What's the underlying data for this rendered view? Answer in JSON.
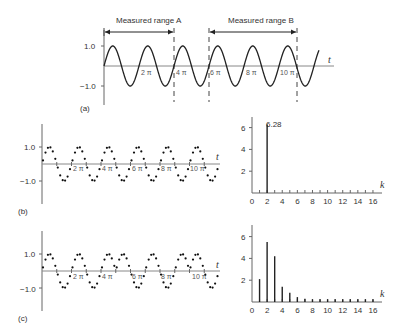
{
  "figure": {
    "panel_a": {
      "label": "(a)",
      "range_a_label": "Measured range A",
      "range_b_label": "Measured range B",
      "y_ticks": [
        "1.0",
        "−1.0"
      ],
      "x_axis_label": "t",
      "x_tick_labels": [
        "2 π",
        "4 π",
        "6 π",
        "8 π",
        "10 π"
      ]
    },
    "panel_b": {
      "label": "(b)",
      "y_ticks": [
        "1.0",
        "−1.0"
      ],
      "x_axis_label": "t",
      "x_tick_labels": [
        "2 π",
        "4 π",
        "6 π",
        "8 π",
        "10 π"
      ]
    },
    "panel_c": {
      "label": "(c)",
      "y_ticks": [
        "1.0",
        "−1.0"
      ],
      "x_axis_label": "t",
      "x_tick_labels": [
        "2 π",
        "4 π",
        "6 π",
        "8 π",
        "10 π"
      ]
    }
  },
  "chart_data": [
    {
      "type": "line",
      "title": "(a) Continuous sine wave with measured ranges A and B",
      "xlabel": "t",
      "ylabel": "",
      "yticks": [
        1.0,
        -1.0
      ],
      "x_tick_labels": [
        "2π",
        "4π",
        "6π",
        "8π",
        "10π"
      ],
      "annotations": [
        "Measured range A",
        "Measured range B"
      ],
      "ylim": [
        -1.0,
        1.0
      ]
    },
    {
      "type": "scatter",
      "title": "(b) Sampled signal, integer number of periods",
      "xlabel": "t",
      "yticks": [
        1.0,
        -1.0
      ],
      "x_tick_labels": [
        "2π",
        "4π",
        "6π",
        "8π",
        "10π"
      ],
      "ylim": [
        -1.0,
        1.0
      ]
    },
    {
      "type": "bar",
      "title": "(b) Spectrum",
      "xlabel": "k",
      "categories": [
        0,
        1,
        2,
        3,
        4,
        5,
        6,
        7,
        8,
        9,
        10,
        11,
        12,
        13,
        14,
        15,
        16
      ],
      "values": [
        0,
        0,
        6.28,
        0,
        0,
        0,
        0,
        0,
        0,
        0,
        0,
        0,
        0,
        0,
        0,
        0,
        0
      ],
      "annotations": [
        "6.28"
      ],
      "yticks": [
        2,
        4,
        6
      ],
      "xticks": [
        0,
        2,
        4,
        6,
        8,
        10,
        12,
        14,
        16
      ],
      "ylim": [
        0,
        7
      ]
    },
    {
      "type": "scatter",
      "title": "(c) Sampled signal, non-integer number of periods (periodic extension)",
      "xlabel": "t",
      "yticks": [
        1.0,
        -1.0
      ],
      "x_tick_labels": [
        "2π",
        "4π",
        "6π",
        "8π",
        "10π"
      ],
      "ylim": [
        -1.0,
        1.0
      ]
    },
    {
      "type": "bar",
      "title": "(c) Spectrum (leakage)",
      "xlabel": "k",
      "categories": [
        0,
        1,
        2,
        3,
        4,
        5,
        6,
        7,
        8,
        9,
        10,
        11,
        12,
        13,
        14,
        15,
        16
      ],
      "values": [
        0,
        2.1,
        5.5,
        4.2,
        1.4,
        0.85,
        0.45,
        0.3,
        0.25,
        0.25,
        0.25,
        0.25,
        0.25,
        0.25,
        0.25,
        0.25,
        0.25
      ],
      "yticks": [
        2,
        4,
        6
      ],
      "xticks": [
        0,
        2,
        4,
        6,
        8,
        10,
        12,
        14,
        16
      ],
      "ylim": [
        0,
        7
      ]
    }
  ]
}
